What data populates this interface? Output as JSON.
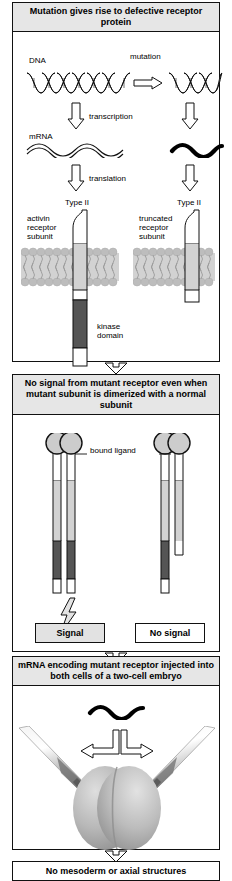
{
  "figure": {
    "title": "Mutation gives rise to defective receptor protein"
  },
  "panels": [
    {
      "id": "panel-mutation",
      "header": "Mutation gives rise to defective\nreceptor protein",
      "labels": {
        "dna": "DNA",
        "mutation": "mutation",
        "transcription": "transcription",
        "mrna": "mRNA",
        "translation": "translation",
        "type_ii_left": "Type II",
        "type_ii_right": "Type II",
        "activin_receptor_subunit": "activin\nreceptor\nsubunit",
        "truncated_receptor_subunit": "truncated\nreceptor\nsubunit",
        "kinase_domain": "kinase\ndomain"
      }
    },
    {
      "id": "panel-no-signal",
      "header": "No signal from mutant receptor even when mutant\nsubunit is dimerized with a normal subunit",
      "labels": {
        "bound_ligand": "bound ligand",
        "signal": "Signal",
        "no_signal": "No signal"
      }
    },
    {
      "id": "panel-injection",
      "header": "mRNA encoding mutant receptor injected\ninto both cells of a two-cell embryo",
      "labels": {}
    },
    {
      "id": "panel-result",
      "header": "No mesoderm or axial structures",
      "labels": {}
    }
  ],
  "icons": {
    "dna_helix": "dna-helix-icon",
    "mutation_arrow": "right-arrow-icon",
    "transcription_arrow": "down-arrow-icon",
    "translation_arrow": "down-arrow-icon",
    "mrna_squiggle": "mrna-squiggle-icon",
    "membrane": "lipid-bilayer-icon",
    "ligand": "bound-ligand-icon",
    "lightning": "lightning-bolt-icon",
    "pipette": "micropipette-icon",
    "embryo": "two-cell-embryo-icon",
    "connector": "down-arrow-connector-icon"
  },
  "colors": {
    "header_bg": "#e6e6e6",
    "border": "#111111",
    "kinase_domain": "#555555",
    "membrane_band": "#d0d0d0",
    "lipid_head": "#b8b8b8",
    "ligand_fill": "#c8c8c8",
    "embryo_fill": "#b4b4b4",
    "signal_box_fill": "#e2e2e2",
    "text": "#000000"
  }
}
